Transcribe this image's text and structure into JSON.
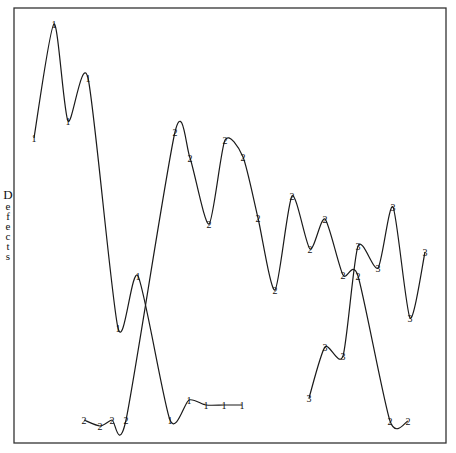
{
  "chart_data": {
    "type": "line",
    "title": "",
    "xlabel": "",
    "ylabel": "Defects",
    "ylim": [
      0,
      100
    ],
    "grid": false,
    "legend": "none (series identified by numeric point markers 1, 2, 3)",
    "frame": {
      "x0": 14,
      "y0": 8,
      "x1": 446,
      "y1": 443
    },
    "series": [
      {
        "name": "1",
        "marker": "1",
        "points_px": [
          [
            34,
            138
          ],
          [
            54,
            24
          ],
          [
            68,
            121
          ],
          [
            88,
            78
          ],
          [
            118,
            328
          ],
          [
            138,
            276
          ],
          [
            170,
            420
          ],
          [
            189,
            400
          ],
          [
            206,
            405
          ],
          [
            224,
            405
          ],
          [
            242,
            405
          ]
        ],
        "values": [
          70.1,
          96.3,
          74.0,
          83.9,
          26.4,
          38.4,
          5.3,
          9.9,
          8.7,
          8.7,
          8.7
        ]
      },
      {
        "name": "2",
        "marker": "2",
        "points_px": [
          [
            84,
            420
          ],
          [
            100,
            426
          ],
          [
            112,
            420
          ],
          [
            126,
            420
          ],
          [
            175,
            132
          ],
          [
            190,
            158
          ],
          [
            209,
            224
          ],
          [
            225,
            140
          ],
          [
            243,
            157
          ],
          [
            258,
            218
          ],
          [
            275,
            290
          ],
          [
            292,
            196
          ],
          [
            310,
            249
          ],
          [
            325,
            219
          ],
          [
            343,
            275
          ],
          [
            358,
            276
          ],
          [
            390,
            421
          ],
          [
            408,
            421
          ]
        ],
        "values": [
          5.3,
          3.9,
          5.3,
          5.3,
          71.5,
          65.5,
          50.3,
          69.7,
          65.7,
          51.7,
          35.2,
          56.8,
          44.6,
          51.5,
          38.6,
          38.4,
          5.1,
          5.1
        ]
      },
      {
        "name": "3",
        "marker": "3",
        "points_px": [
          [
            309,
            398
          ],
          [
            325,
            347
          ],
          [
            343,
            356
          ],
          [
            358,
            246
          ],
          [
            378,
            268
          ],
          [
            393,
            207
          ],
          [
            410,
            318
          ],
          [
            425,
            252
          ]
        ],
        "values": [
          10.3,
          22.1,
          20.0,
          45.3,
          40.2,
          54.3,
          28.7,
          43.9
        ]
      }
    ]
  },
  "axis": {
    "ylabel_letters": [
      "D",
      "e",
      "f",
      "e",
      "c",
      "t",
      "s"
    ]
  }
}
